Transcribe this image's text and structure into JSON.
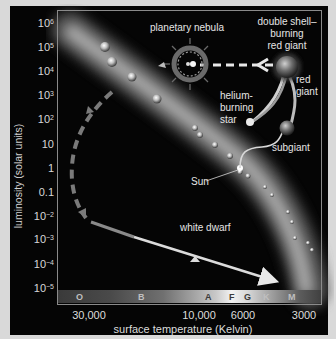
{
  "diagram": {
    "type": "Hertzsprung-Russell diagram",
    "y_axis": {
      "label": "luminosity (solar units)",
      "ticks": [
        {
          "base": "10",
          "exp": "6"
        },
        {
          "base": "10",
          "exp": "5"
        },
        {
          "base": "10",
          "exp": "4"
        },
        {
          "base": "10",
          "exp": "3"
        },
        {
          "base": "10",
          "exp": "2"
        },
        {
          "base": "10",
          "exp": ""
        },
        {
          "base": "1",
          "exp": ""
        },
        {
          "base": "0.1",
          "exp": ""
        },
        {
          "base": "10",
          "exp": "−2"
        },
        {
          "base": "10",
          "exp": "−3"
        },
        {
          "base": "10",
          "exp": "−4"
        },
        {
          "base": "10",
          "exp": "−5"
        }
      ]
    },
    "x_axis": {
      "label": "surface temperature (Kelvin)",
      "ticks": [
        "30,000",
        "10,000",
        "6000",
        "3000"
      ]
    },
    "spectral_classes": [
      "O",
      "B",
      "A",
      "F",
      "G",
      "K",
      "M"
    ],
    "annotations": {
      "planetary_nebula": "planetary nebula",
      "double_shell_line1": "double shell–",
      "double_shell_line2": "burning",
      "double_shell_line3": "red giant",
      "red_giant_line1": "red",
      "red_giant_line2": "giant",
      "helium_line1": "helium-",
      "helium_line2": "burning",
      "helium_line3": "star",
      "subgiant": "subgiant",
      "sun": "Sun",
      "white_dwarf": "white dwarf"
    },
    "colors": {
      "background_outer": "#d9d9d9",
      "panel": "#050505",
      "main_sequence_band": "#9a9a9a",
      "path_solid": "#e0e0e0",
      "path_dashed": "#7a7a7a",
      "text": "#e6e6e6"
    }
  }
}
